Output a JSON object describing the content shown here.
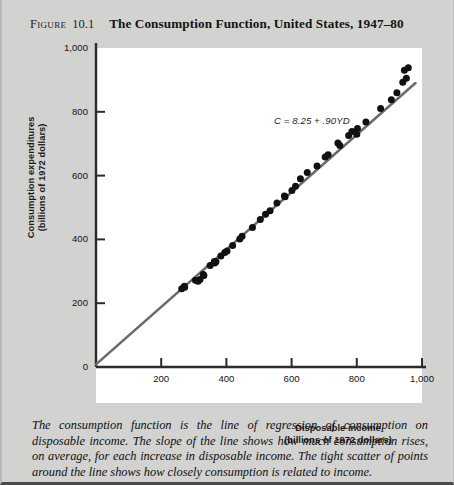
{
  "figure": {
    "label": "Figure",
    "number": "10.1",
    "title": "The Consumption Function, United States, 1947–80",
    "caption": "The consumption function is the line of regression of consumption on disposable income.  The slope of the line shows how much consumption rises, on average, for each increase in disposable income.  The tight scatter of points around the line shows how closely consumption is related to income."
  },
  "chart_data": {
    "type": "scatter",
    "title": "The Consumption Function, United States, 1947–80",
    "xlabel": "Disposable income",
    "xlabel_units": "(billions of 1972 dollars)",
    "ylabel": "Consumption expenditures",
    "ylabel_units": "(billions of 1972 dollars)",
    "xlim": [
      0,
      1000
    ],
    "ylim": [
      0,
      1000
    ],
    "xticks": [
      200,
      400,
      600,
      800,
      1000
    ],
    "xtick_labels": [
      "200",
      "400",
      "600",
      "800",
      "1,000"
    ],
    "yticks": [
      0,
      200,
      400,
      600,
      800,
      1000
    ],
    "ytick_labels": [
      "0",
      "200",
      "400",
      "600",
      "800",
      "1,000"
    ],
    "grid": false,
    "legend": false,
    "annotation": "C = 8.25 + .90YD",
    "annotation_position": [
      560,
      790
    ],
    "regression_line": {
      "intercept": 8.25,
      "slope": 0.9,
      "x_start": 0,
      "x_end": 980,
      "color": "#6b6b6b"
    },
    "point_color": "#111111",
    "series": [
      {
        "name": "Annual observations 1947–80",
        "points": [
          [
            263,
            245
          ],
          [
            272,
            250
          ],
          [
            271,
            253
          ],
          [
            305,
            272
          ],
          [
            313,
            269
          ],
          [
            319,
            274
          ],
          [
            331,
            287
          ],
          [
            329,
            290
          ],
          [
            350,
            318
          ],
          [
            364,
            326
          ],
          [
            368,
            330
          ],
          [
            363,
            331
          ],
          [
            383,
            348
          ],
          [
            395,
            359
          ],
          [
            402,
            364
          ],
          [
            419,
            381
          ],
          [
            441,
            401
          ],
          [
            448,
            410
          ],
          [
            480,
            437
          ],
          [
            504,
            462
          ],
          [
            520,
            479
          ],
          [
            534,
            490
          ],
          [
            555,
            514
          ],
          [
            580,
            534
          ],
          [
            578,
            536
          ],
          [
            601,
            553
          ],
          [
            612,
            567
          ],
          [
            627,
            590
          ],
          [
            648,
            610
          ],
          [
            678,
            630
          ],
          [
            703,
            658
          ],
          [
            712,
            665
          ],
          [
            748,
            694
          ],
          [
            742,
            702
          ],
          [
            775,
            726
          ],
          [
            785,
            738
          ],
          [
            800,
            730
          ],
          [
            802,
            748
          ],
          [
            828,
            768
          ],
          [
            873,
            810
          ],
          [
            906,
            838
          ],
          [
            923,
            860
          ],
          [
            941,
            893
          ],
          [
            952,
            905
          ],
          [
            946,
            930
          ],
          [
            958,
            938
          ]
        ]
      }
    ]
  }
}
